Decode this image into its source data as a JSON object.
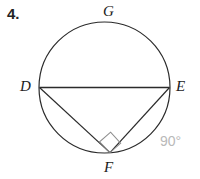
{
  "figure": {
    "problem_number": "4.",
    "canvas": {
      "width": 200,
      "height": 179,
      "background": "#ffffff"
    },
    "stroke_color": "#2b2b2b",
    "annotation_color": "#b9b9b9",
    "circle": {
      "cx": 104.5,
      "cy": 87.5,
      "r": 65.5
    },
    "points": {
      "D": {
        "x": 39.5,
        "y": 87.5
      },
      "E": {
        "x": 169.5,
        "y": 87.5
      },
      "F": {
        "x": 110.0,
        "y": 152.6
      },
      "G": {
        "x": 110.0,
        "y": 23.0
      }
    },
    "segments": [
      {
        "name": "DE",
        "x1": 39.5,
        "y1": 87.5,
        "x2": 169.5,
        "y2": 87.5
      },
      {
        "name": "DF",
        "x1": 39.5,
        "y1": 87.5,
        "x2": 110.0,
        "y2": 152.6
      },
      {
        "name": "EF",
        "x1": 169.5,
        "y1": 87.5,
        "x2": 110.0,
        "y2": 152.6
      }
    ],
    "right_angle_marker": {
      "at_vertex": "F",
      "points": "110,152.6 99.6,141.8 110.6,132.2 120.6,143.2"
    },
    "labels": {
      "G": "G",
      "D": "D",
      "E": "E",
      "F": "F"
    },
    "annotations": {
      "angle_measure": "90°"
    }
  }
}
